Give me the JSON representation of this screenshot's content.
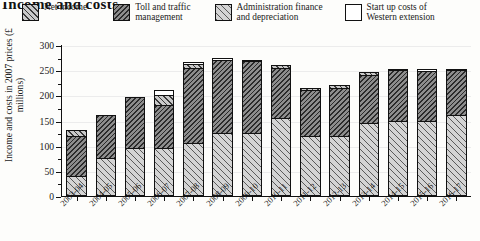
{
  "title": "Income and costs",
  "legend": {
    "items": [
      {
        "label": "Net income",
        "swatch": "hatch-net-income",
        "color": "#c9c9c9"
      },
      {
        "label": "Toll and traffic\nmanagement",
        "swatch": "hatch-toll-traffic",
        "color": "#8d8d8d"
      },
      {
        "label": "Administration finance\nand depreciation",
        "swatch": "hatch-admin-finance",
        "color": "#d4d4d4"
      },
      {
        "label": "Start up costs of\nWestern extension",
        "swatch": "plain-start-up",
        "color": "#ffffff"
      }
    ]
  },
  "axes": {
    "ylabel": "Income and costs\nin 2007 prices (£ millions)",
    "yticks": [
      0,
      50,
      100,
      150,
      200,
      250,
      300
    ],
    "ylim": [
      0,
      300
    ],
    "xlabel": ""
  },
  "chart_data": {
    "type": "bar",
    "title": "Income and costs",
    "xlabel": "",
    "ylabel": "Income and costs in 2007 prices (£ millions)",
    "ylim": [
      0,
      300
    ],
    "grid": true,
    "stacked": true,
    "legend_position": "top",
    "categories": [
      "2003-04",
      "2004-05",
      "2005-06",
      "2006-07",
      "2007-08",
      "2008-09",
      "2009-10",
      "2010-11",
      "2011-12",
      "2012-13",
      "2013-14",
      "2014-15",
      "2015-16",
      "2016-17"
    ],
    "series": [
      {
        "name": "Administration finance and depreciation",
        "values": [
          40,
          75,
          95,
          95,
          105,
          125,
          125,
          155,
          120,
          120,
          145,
          150,
          150,
          160
        ]
      },
      {
        "name": "Toll and traffic management",
        "values": [
          80,
          85,
          102,
          85,
          150,
          145,
          143,
          100,
          90,
          95,
          95,
          100,
          98,
          90
        ]
      },
      {
        "name": "Net income",
        "values": [
          12,
          0,
          0,
          20,
          7,
          0,
          0,
          5,
          5,
          5,
          6,
          0,
          0,
          0
        ]
      },
      {
        "name": "Start up costs of Western extension",
        "values": [
          0,
          0,
          0,
          10,
          5,
          5,
          3,
          0,
          0,
          0,
          0,
          3,
          5,
          2
        ]
      }
    ],
    "totals": [
      132,
      160,
      197,
      210,
      267,
      275,
      271,
      260,
      215,
      220,
      246,
      253,
      253,
      252
    ]
  }
}
